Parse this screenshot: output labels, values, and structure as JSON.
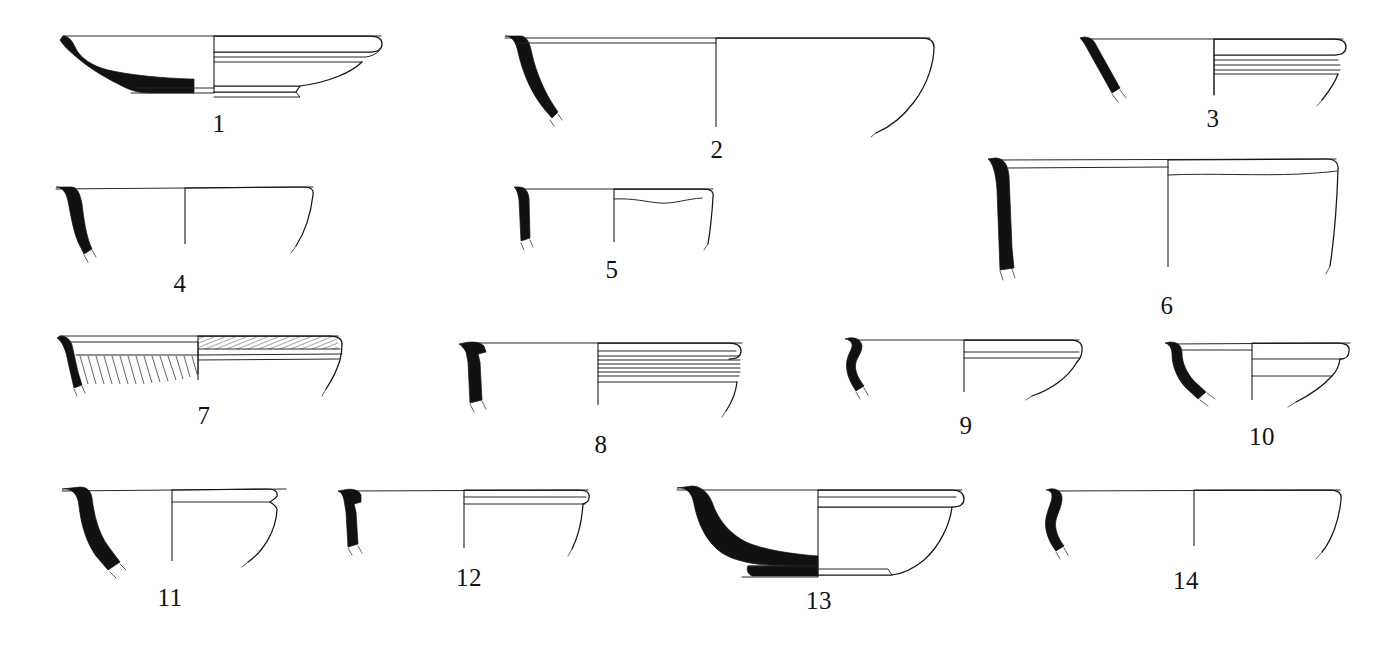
{
  "plate": {
    "kind": "archaeological-pottery-profile-plate",
    "background_color": "#ffffff",
    "ink_color": "#151515",
    "section_fill_color": "#111111",
    "width": 1390,
    "height": 650,
    "figure_count": 14,
    "label_font_style": "serif",
    "label_font_size_px": 25
  },
  "figures": [
    {
      "id": "fig-1",
      "label": "1",
      "label_x": 219,
      "label_y": 111,
      "description": "shallow dish with ring foot, solid-black section at left, outline elevation at right",
      "row": 1,
      "column": 1,
      "has_solid_section": true,
      "has_ring_foot": true,
      "has_grooves": true,
      "has_hatching": false
    },
    {
      "id": "fig-2",
      "label": "2",
      "label_x": 717,
      "label_y": 137,
      "description": "large open bowl, thin curved black wall section at left, central axis, flaring elevation at right",
      "row": 1,
      "column": 2,
      "has_solid_section": true,
      "has_ring_foot": false,
      "has_grooves": false,
      "has_hatching": false
    },
    {
      "id": "fig-3",
      "label": "3",
      "label_x": 1213,
      "label_y": 106,
      "description": "rim sherd, short slanted black rim section, horizontal grooves below rim on elevation",
      "row": 1,
      "column": 3,
      "has_solid_section": true,
      "has_ring_foot": false,
      "has_grooves": true,
      "has_hatching": false
    },
    {
      "id": "fig-4",
      "label": "4",
      "label_x": 180,
      "label_y": 271,
      "description": "bowl with S-curved black wall section and thin everted rim",
      "row": 2,
      "column": 1,
      "has_solid_section": true,
      "has_ring_foot": false,
      "has_grooves": false,
      "has_hatching": false
    },
    {
      "id": "fig-5",
      "label": "5",
      "label_x": 612,
      "label_y": 257,
      "description": "small vessel rim, near-vertical black wall section, wavy incised line on elevation",
      "row": 2,
      "column": 2,
      "has_solid_section": true,
      "has_ring_foot": false,
      "has_grooves": false,
      "has_hatching": false
    },
    {
      "id": "fig-6",
      "label": "6",
      "label_x": 1167,
      "label_y": 293,
      "description": "large deep basin, thick black wall section at left, banded line below rim on elevation",
      "row": 2,
      "column": 3,
      "has_solid_section": true,
      "has_ring_foot": false,
      "has_grooves": true,
      "has_hatching": false
    },
    {
      "id": "fig-7",
      "label": "7",
      "label_x": 204,
      "label_y": 403,
      "description": "rim with dense diagonal combed hatching below rim and on exterior rim band",
      "row": 3,
      "column": 1,
      "has_solid_section": true,
      "has_ring_foot": false,
      "has_grooves": false,
      "has_hatching": true
    },
    {
      "id": "fig-8",
      "label": "8",
      "label_x": 601,
      "label_y": 432,
      "description": "thickened black rim section with interior projection, multiple close horizontal grooves on elevation",
      "row": 3,
      "column": 2,
      "has_solid_section": true,
      "has_ring_foot": false,
      "has_grooves": true,
      "has_hatching": false
    },
    {
      "id": "fig-9",
      "label": "9",
      "label_x": 966,
      "label_y": 413,
      "description": "small bowl with hooked black rim profile and two horizontal lines on elevation",
      "row": 3,
      "column": 3,
      "has_solid_section": true,
      "has_ring_foot": false,
      "has_grooves": true,
      "has_hatching": false
    },
    {
      "id": "fig-10",
      "label": "10",
      "label_x": 1262,
      "label_y": 424,
      "description": "small carinated bowl, hooked black rim section, angled body on elevation",
      "row": 3,
      "column": 4,
      "has_solid_section": true,
      "has_ring_foot": false,
      "has_grooves": true,
      "has_hatching": false
    },
    {
      "id": "fig-11",
      "label": "11",
      "label_x": 170,
      "label_y": 585,
      "description": "deep bowl, thick strongly curved black section, thickened rim on elevation",
      "row": 4,
      "column": 1,
      "has_solid_section": true,
      "has_ring_foot": false,
      "has_grooves": true,
      "has_hatching": false
    },
    {
      "id": "fig-12",
      "label": "12",
      "label_x": 469,
      "label_y": 565,
      "description": "small flaring bowl, tiny black rim fragment, banded rim on elevation",
      "row": 4,
      "column": 2,
      "has_solid_section": true,
      "has_ring_foot": false,
      "has_grooves": true,
      "has_hatching": false
    },
    {
      "id": "fig-13",
      "label": "13",
      "label_x": 819,
      "label_y": 588,
      "description": "complete shallow bowl, thick black section with low ring foot, outline elevation at right",
      "row": 4,
      "column": 3,
      "has_solid_section": true,
      "has_ring_foot": true,
      "has_grooves": false,
      "has_hatching": false
    },
    {
      "id": "fig-14",
      "label": "14",
      "label_x": 1186,
      "label_y": 568,
      "description": "wide shallow bowl, small hooked black rim section at far left, central axis",
      "row": 4,
      "column": 4,
      "has_solid_section": true,
      "has_ring_foot": false,
      "has_grooves": false,
      "has_hatching": false
    }
  ]
}
